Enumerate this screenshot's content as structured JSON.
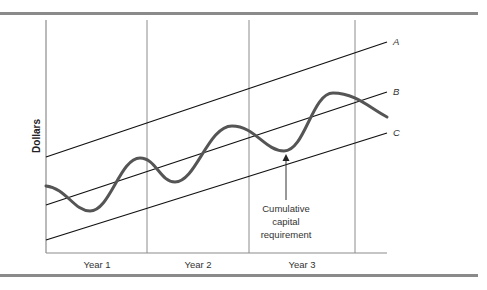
{
  "diagram": {
    "ylabel": "Dollars",
    "x_labels": [
      "Year 1",
      "Year 2",
      "Year 3"
    ],
    "lines": [
      {
        "name": "A"
      },
      {
        "name": "B"
      },
      {
        "name": "C"
      }
    ],
    "annotation": {
      "lines": [
        "Cumulative",
        "capital",
        "requirement"
      ]
    }
  }
}
